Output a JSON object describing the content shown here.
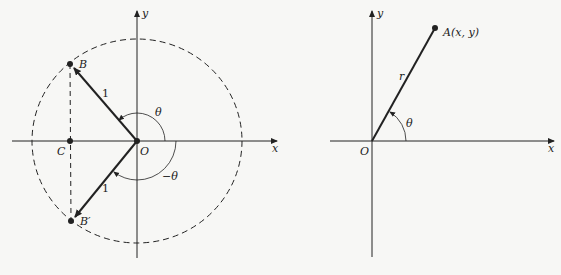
{
  "left_diagram": {
    "axes": {
      "x_label": "x",
      "y_label": "y"
    },
    "points": {
      "origin": "O",
      "b": "B",
      "c": "C",
      "b_prime": "B′"
    },
    "segment_labels": {
      "ob_length": "1",
      "ob_prime_length": "1"
    },
    "angle_labels": {
      "theta": "θ",
      "neg_theta": "−θ"
    },
    "circle": "unit circle (dashed)"
  },
  "right_diagram": {
    "axes": {
      "x_label": "x",
      "y_label": "y"
    },
    "points": {
      "origin": "O",
      "a": "A(x, y)"
    },
    "segment_labels": {
      "oa_length": "r"
    },
    "angle_labels": {
      "theta": "θ"
    }
  },
  "colors": {
    "ink": "#222222",
    "background": "#f7f7f5"
  }
}
